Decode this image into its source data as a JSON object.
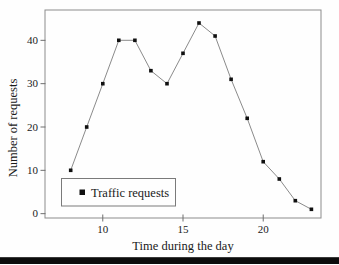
{
  "chart_data": {
    "type": "line",
    "xlabel": "Time during the day",
    "ylabel": "Number of requests",
    "x": [
      8,
      9,
      10,
      11,
      12,
      13,
      14,
      15,
      16,
      17,
      18,
      19,
      20,
      21,
      22,
      23
    ],
    "series": [
      {
        "name": "Traffic requests",
        "values": [
          10,
          20,
          30,
          40,
          40,
          33,
          30,
          37,
          44,
          41,
          31,
          22,
          12,
          8,
          3,
          1
        ]
      }
    ],
    "x_ticks": [
      10,
      15,
      20
    ],
    "y_ticks": [
      0,
      10,
      20,
      30,
      40
    ],
    "xlim": [
      6.4,
      23.6
    ],
    "ylim": [
      -1,
      47
    ],
    "grid": false,
    "legend_position": "lower-left",
    "marker_shape": "square",
    "colors": {
      "line": "#7d7d7d",
      "marker": "#101010",
      "frame": "#8c8c8c",
      "tick": "#6e6e6e",
      "text": "#1a1a1a",
      "legend_border": "#7a7a7a",
      "legend_fill": "#fefefe",
      "bottom_bar": "#0c0c0c"
    }
  }
}
